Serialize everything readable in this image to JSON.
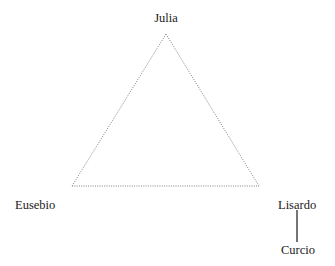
{
  "diagram": {
    "type": "relationship-triangle",
    "background_color": "#ffffff",
    "edge_color": "#808080",
    "connector_color": "#1a1a1a",
    "text_color": "#1a1a1a",
    "nodes": [
      {
        "id": "julia",
        "label": "Julia",
        "x": 166,
        "y": 34,
        "role": "apex"
      },
      {
        "id": "eusebio",
        "label": "Eusebio",
        "x": 72,
        "y": 186,
        "role": "bottom-left"
      },
      {
        "id": "lisardo",
        "label": "Lisardo",
        "x": 259,
        "y": 186,
        "role": "bottom-right"
      },
      {
        "id": "curcio",
        "label": "Curcio",
        "x": 297,
        "y": 248,
        "role": "below-lisardo"
      }
    ],
    "edges": [
      {
        "from": "eusebio",
        "to": "julia",
        "style": "dotted"
      },
      {
        "from": "julia",
        "to": "lisardo",
        "style": "dotted"
      },
      {
        "from": "eusebio",
        "to": "lisardo",
        "style": "dotted"
      },
      {
        "from": "lisardo",
        "to": "curcio",
        "style": "solid"
      }
    ],
    "geometry": {
      "apex": {
        "x": 166,
        "y": 34
      },
      "bottom_left": {
        "x": 72,
        "y": 186
      },
      "bottom_right": {
        "x": 259,
        "y": 186
      },
      "connector_line": {
        "x": 297,
        "y1": 210,
        "y2": 242
      }
    }
  }
}
